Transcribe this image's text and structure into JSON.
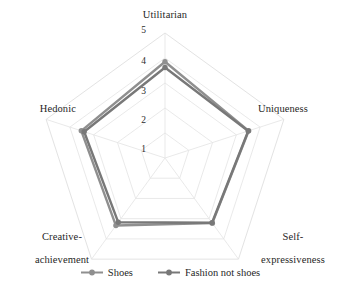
{
  "chart_data": {
    "type": "radar",
    "title": "",
    "categories": [
      "Utilitarian",
      "Uniqueness",
      "Self-expressiveness",
      "Creative-achievement",
      "Hedonic"
    ],
    "category_labels": {
      "utilitarian": "Utilitarian",
      "uniqueness": "Uniqueness",
      "self_expressiveness_line1": "Self-",
      "self_expressiveness_line2": "expressiveness",
      "creative_achievement_line1": "Creative-",
      "creative_achievement_line2": "achievement",
      "hedonic": "Hedonic"
    },
    "tick_labels": [
      "1",
      "2",
      "3",
      "4",
      "5"
    ],
    "rlim": [
      0,
      5
    ],
    "grid": true,
    "legend_position": "bottom",
    "series": [
      {
        "name": "Shoes",
        "color": "#8f8f8f",
        "values": [
          3.85,
          3.52,
          3.22,
          3.34,
          3.52
        ]
      },
      {
        "name": "Fashion not shoes",
        "color": "#787878",
        "values": [
          3.62,
          3.5,
          3.2,
          3.18,
          3.4
        ]
      }
    ]
  },
  "legend": {
    "items": [
      {
        "label": "Shoes"
      },
      {
        "label": "Fashion not shoes"
      }
    ]
  },
  "style": {
    "grid_color": "#e3e3e3",
    "spoke_color": "#e3e3e3",
    "text_color": "#1f1f1f",
    "background": "#ffffff"
  }
}
